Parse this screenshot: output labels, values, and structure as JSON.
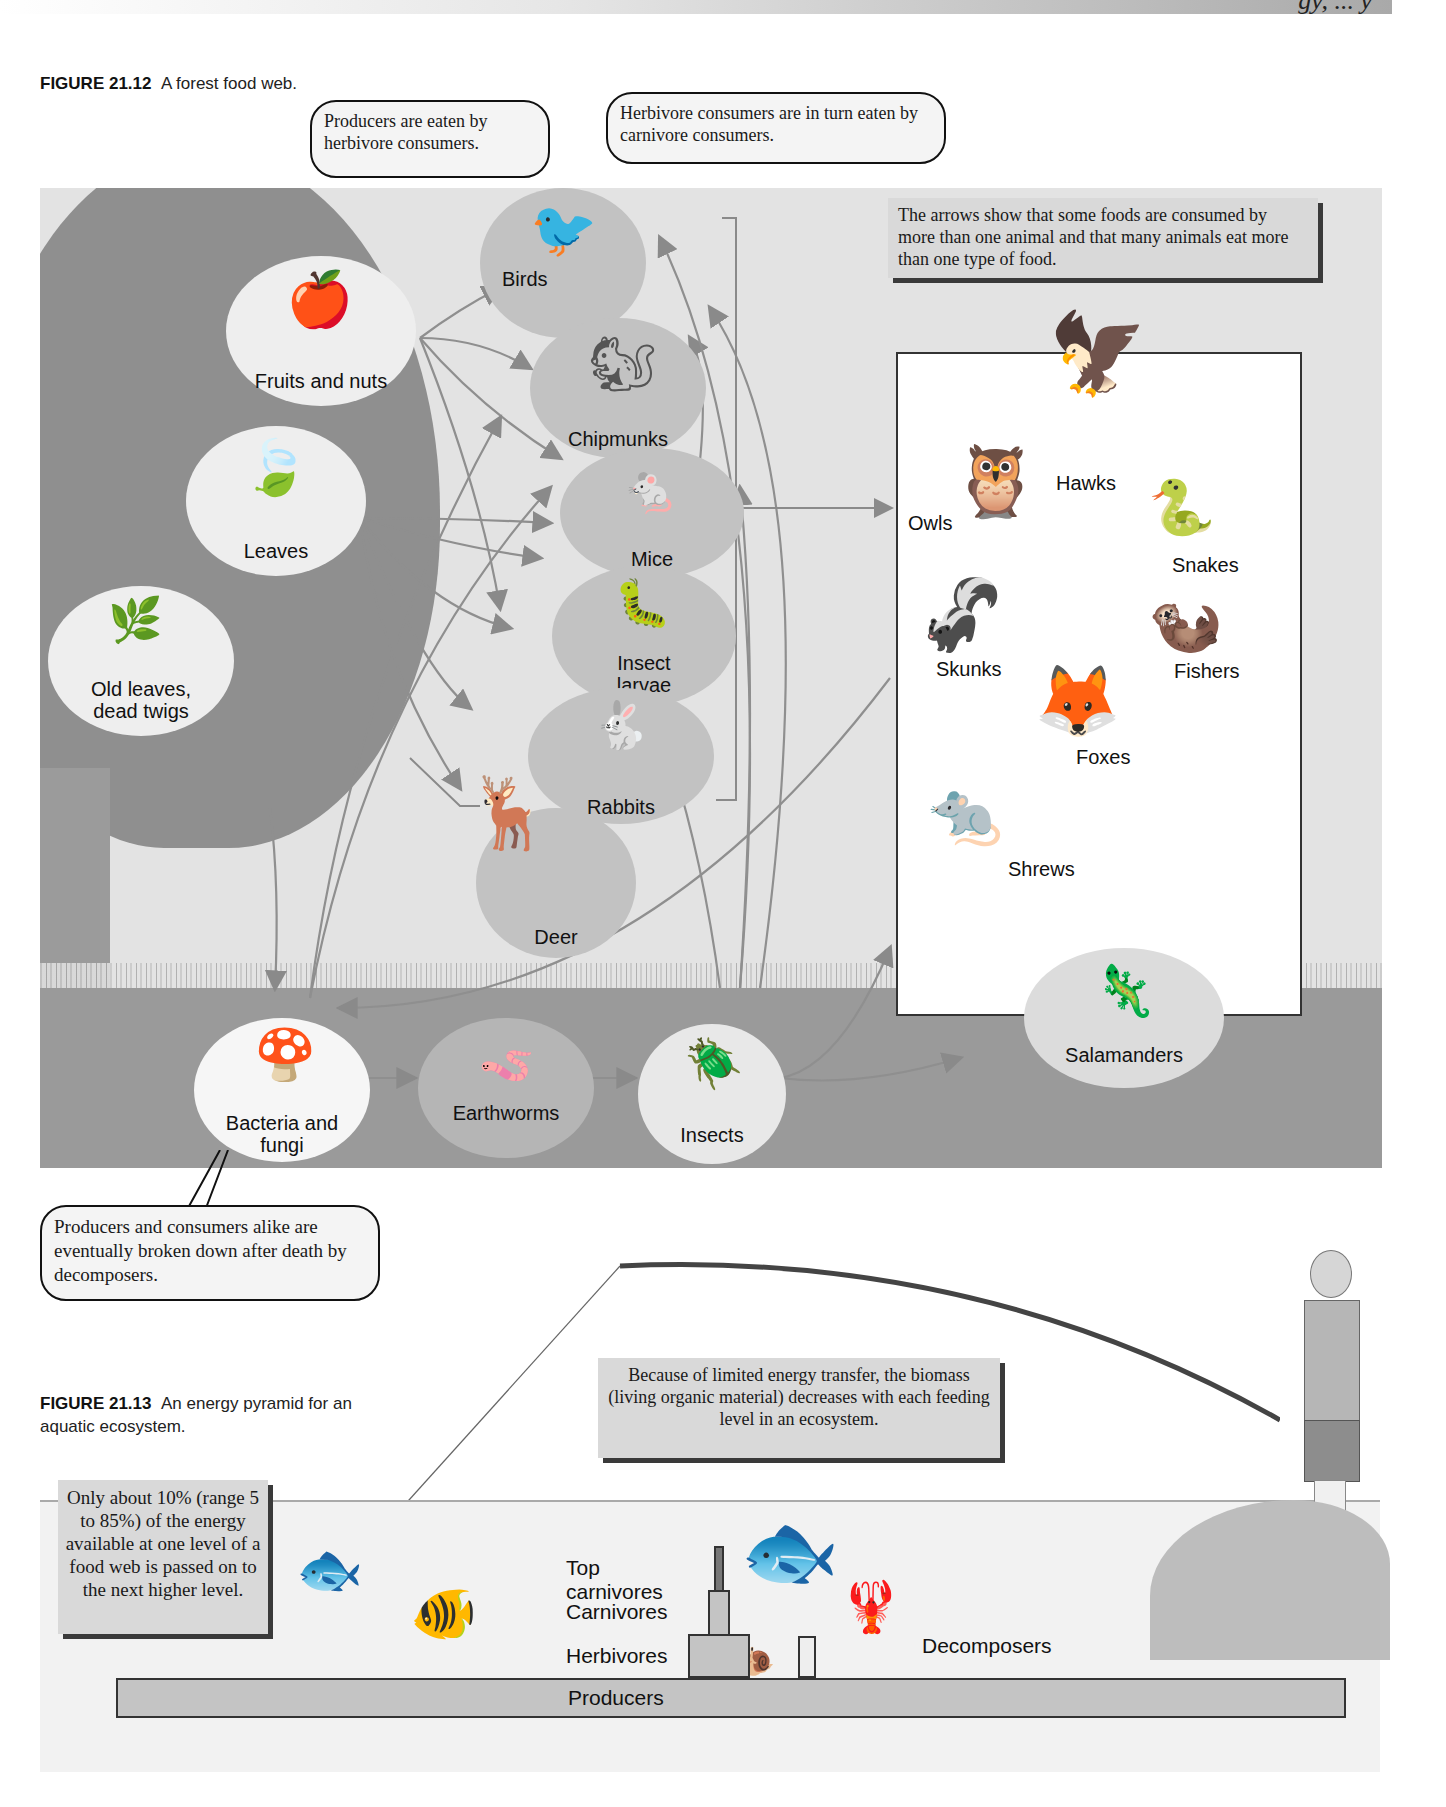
{
  "page": {
    "running_header_fragment": "gy, ... y"
  },
  "figure_21_12": {
    "number": "FIGURE 21.12",
    "caption": "A forest food web.",
    "callouts": {
      "producers": "Producers are eaten by herbivore consumers.",
      "herbivores": "Herbivore consumers are in turn eaten by carnivore consumers.",
      "arrows_note": "The arrows show that some foods are consumed by more than one animal and that many animals eat more than one type of food.",
      "decomposers": "Producers and consumers alike are eventually broken down after death by decomposers."
    },
    "producers": [
      {
        "label": "Fruits and nuts",
        "icon": "fruit-icon"
      },
      {
        "label": "Leaves",
        "icon": "leaf-icon"
      },
      {
        "label": "Old leaves, dead twigs",
        "icon": "twig-icon"
      }
    ],
    "herbivores": [
      {
        "label": "Birds",
        "icon": "bird-icon"
      },
      {
        "label": "Chipmunks",
        "icon": "chipmunk-icon"
      },
      {
        "label": "Mice",
        "icon": "mouse-icon"
      },
      {
        "label": "Insect larvae",
        "icon": "caterpillar-icon"
      },
      {
        "label": "Rabbits",
        "icon": "rabbit-icon"
      },
      {
        "label": "Deer",
        "icon": "deer-icon"
      }
    ],
    "carnivores": [
      {
        "label": "Hawks",
        "icon": "hawk-icon"
      },
      {
        "label": "Owls",
        "icon": "owl-icon"
      },
      {
        "label": "Snakes",
        "icon": "snake-icon"
      },
      {
        "label": "Skunks",
        "icon": "skunk-icon"
      },
      {
        "label": "Fishers",
        "icon": "fisher-icon"
      },
      {
        "label": "Foxes",
        "icon": "fox-icon"
      },
      {
        "label": "Shrews",
        "icon": "shrew-icon"
      },
      {
        "label": "Salamanders",
        "icon": "salamander-icon"
      }
    ],
    "decomposer_chain": [
      {
        "label": "Bacteria and fungi",
        "icon": "mushroom-icon"
      },
      {
        "label": "Earthworms",
        "icon": "worm-icon"
      },
      {
        "label": "Insects",
        "icon": "beetle-icon"
      }
    ]
  },
  "figure_21_13": {
    "number": "FIGURE 21.13",
    "caption": "An energy pyramid for an aquatic ecosystem.",
    "biomass_note": "Because of limited energy transfer, the biomass (living organic material) decreases with each feeding level in an ecosystem.",
    "energy_note": "Only about 10% (range 5 to 85%) of the energy available at one level of a food web is passed on to the next higher level.",
    "levels": [
      {
        "label": "Top carnivores"
      },
      {
        "label": "Carnivores"
      },
      {
        "label": "Herbivores"
      },
      {
        "label": "Producers"
      }
    ],
    "side_level": {
      "label": "Decomposers"
    },
    "icons": [
      "fish-icon",
      "bass-icon",
      "crayfish-icon",
      "snail-icon",
      "angler-icon"
    ]
  }
}
